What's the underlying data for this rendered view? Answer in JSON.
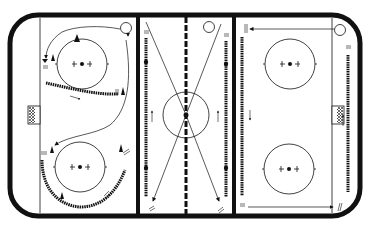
{
  "diagram": {
    "type": "ice-hockey-rink-drill",
    "colors": {
      "ink": "#111111",
      "background": "#ffffff"
    },
    "rink": {
      "zones": [
        "left-defensive-zone",
        "neutral-zone",
        "right-offensive-zone"
      ],
      "features": [
        "boards",
        "blue-lines",
        "center-red-line",
        "goal-lines",
        "nets",
        "faceoff-circles",
        "center-circle"
      ]
    },
    "markers": {
      "start_label": "S"
    },
    "zones": [
      {
        "name": "left-zone",
        "start_marker": "S",
        "elements": [
          "start-circle",
          "skating-path-circle",
          "puck-chain-line",
          "cones",
          "pass-arrow",
          "curved-skate-path",
          "puck-chain-arc"
        ]
      },
      {
        "name": "neutral-zone",
        "start_marker": "S",
        "elements": [
          "two-vertical-puck-chains",
          "crossing-diagonal-paths",
          "up-arrows"
        ]
      },
      {
        "name": "right-zone",
        "start_marker": "S",
        "elements": [
          "horizontal-top-arrow",
          "horizontal-bottom-arrow",
          "left-puck-chain",
          "right-puck-chain",
          "up-arrow"
        ]
      }
    ]
  }
}
